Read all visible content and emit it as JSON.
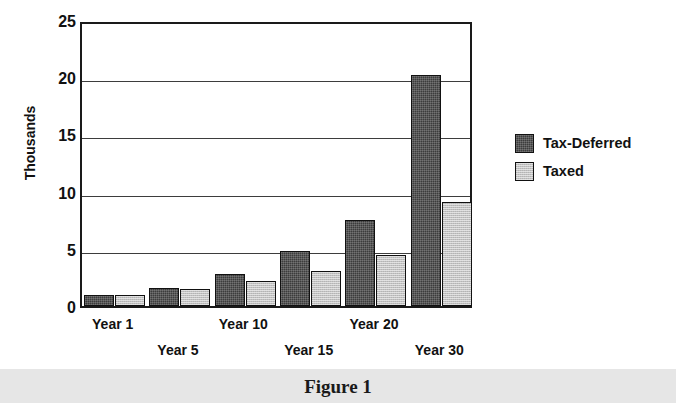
{
  "figure": {
    "caption": "Figure 1",
    "caption_band_color": "#e6e6e6"
  },
  "chart_data": {
    "type": "bar",
    "title": "",
    "xlabel": "",
    "ylabel": "Thousands",
    "categories": [
      "Year 1",
      "Year 5",
      "Year 10",
      "Year 15",
      "Year 20",
      "Year 30"
    ],
    "series": [
      {
        "name": "Tax-Deferred",
        "color": "#3c3c3c",
        "values": [
          1.0,
          1.6,
          2.8,
          4.8,
          7.5,
          20.2
        ]
      },
      {
        "name": "Taxed",
        "color": "#c2c2c2",
        "values": [
          1.0,
          1.5,
          2.2,
          3.1,
          4.5,
          9.1
        ]
      }
    ],
    "ylim": [
      0,
      25
    ],
    "yticks": [
      0,
      5,
      10,
      15,
      20,
      25
    ],
    "ytick_labels": [
      "0",
      "5",
      "10",
      "15",
      "20",
      "25"
    ],
    "grid": true,
    "grid_axis": "y",
    "legend_position": "right",
    "xtick_label_rows": [
      0,
      1,
      0,
      1,
      0,
      1
    ]
  }
}
